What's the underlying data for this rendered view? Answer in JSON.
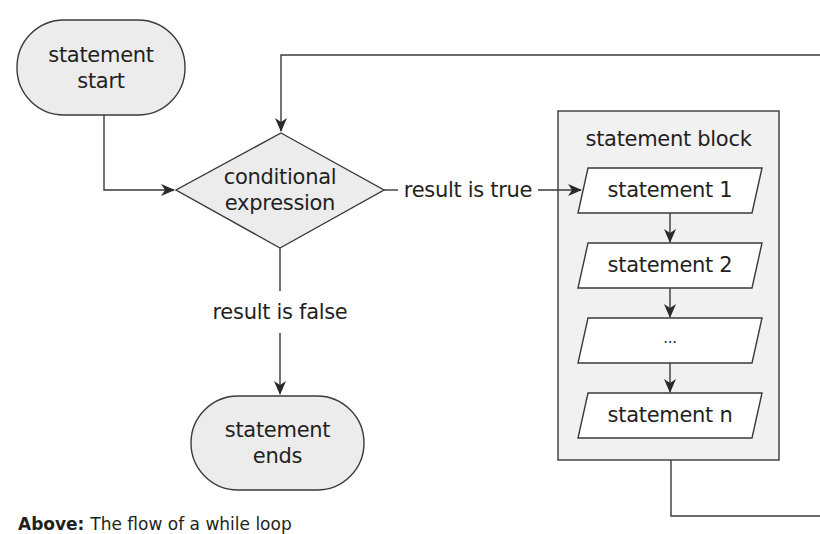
{
  "diagram": {
    "nodes": {
      "start": {
        "type": "terminator",
        "line1": "statement",
        "line2": "start"
      },
      "condition": {
        "type": "decision",
        "line1": "conditional",
        "line2": "expression"
      },
      "end": {
        "type": "terminator",
        "line1": "statement",
        "line2": "ends"
      },
      "block": {
        "type": "group",
        "title": "statement block",
        "statements": [
          "statement 1",
          "statement 2",
          "...",
          "statement n"
        ]
      }
    },
    "edges": {
      "true_label": "result is true",
      "false_label": "result is false"
    },
    "colors": {
      "stroke": "#3a3a3a",
      "terminator_fill": "#ececec",
      "decision_fill": "#ececec",
      "block_fill": "#f1f1f1",
      "statement_fill": "#ffffff"
    }
  },
  "caption": {
    "lead": "Above:",
    "text": "The flow of a while loop"
  }
}
